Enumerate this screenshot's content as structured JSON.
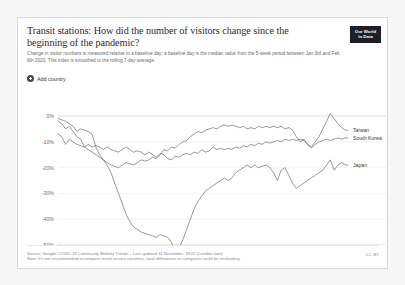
{
  "card": {
    "title": "Transit stations: How did the number of visitors change since the beginning of the pandemic?",
    "subtitle": "Change in visitor numbers is measured relative to a baseline day; a baseline day is the median value from the 5-week period between Jan 3rd and Feb 6th 2020. This index is smoothed to the rolling 7-day average.",
    "logo_line1": "Our World",
    "logo_line2": "in Data"
  },
  "controls": {
    "add_country_label": "Add country",
    "add_country_icon": "plus-circle-icon"
  },
  "footer": {
    "source_line": "Source: Google COVID-19 Community Mobility Trends  –  Last updated 11 November, 18:02 (London time)",
    "note_line": "Note: It's not recommended to compare levels across countries; local differences in categories could be misleading.",
    "license": "CC BY"
  },
  "chart_data": {
    "type": "line",
    "title": "Transit stations: How did the number of visitors change since the beginning of the pandemic?",
    "xlabel": "",
    "ylabel": "",
    "ylim": [
      -55,
      3
    ],
    "xlim": [
      0,
      230
    ],
    "grid": true,
    "legend_position": "right-inline",
    "ytick_labels": [
      "0%",
      "-10%",
      "-20%",
      "-30%",
      "-40%",
      "-50%"
    ],
    "ytick_values": [
      0,
      -10,
      -20,
      -30,
      -40,
      -50
    ],
    "xtick_labels": [
      "Feb 17, 2020",
      "Apr 30",
      "Jun 19",
      "Aug 8",
      "Oct 4, 2020"
    ],
    "xtick_values": [
      0,
      73,
      123,
      173,
      230
    ],
    "series": [
      {
        "name": "Taiwan",
        "label_y": -5.5,
        "values": [
          [
            0,
            -1
          ],
          [
            3,
            -1.5
          ],
          [
            6,
            -2
          ],
          [
            9,
            -3
          ],
          [
            12,
            -4
          ],
          [
            15,
            -6
          ],
          [
            18,
            -5
          ],
          [
            21,
            -5.5
          ],
          [
            24,
            -6
          ],
          [
            27,
            -7
          ],
          [
            30,
            -12
          ],
          [
            33,
            -15
          ],
          [
            36,
            -17
          ],
          [
            39,
            -18
          ],
          [
            42,
            -19
          ],
          [
            45,
            -19.5
          ],
          [
            48,
            -20
          ],
          [
            51,
            -19
          ],
          [
            54,
            -18
          ],
          [
            57,
            -18.5
          ],
          [
            60,
            -19
          ],
          [
            63,
            -18
          ],
          [
            66,
            -17
          ],
          [
            69,
            -17.5
          ],
          [
            72,
            -17
          ],
          [
            75,
            -16
          ],
          [
            78,
            -16.5
          ],
          [
            81,
            -15
          ],
          [
            84,
            -13
          ],
          [
            87,
            -13.5
          ],
          [
            90,
            -12
          ],
          [
            93,
            -12.5
          ],
          [
            96,
            -11
          ],
          [
            99,
            -10
          ],
          [
            102,
            -9.5
          ],
          [
            105,
            -8
          ],
          [
            108,
            -7
          ],
          [
            111,
            -6
          ],
          [
            114,
            -6.5
          ],
          [
            117,
            -5.5
          ],
          [
            120,
            -5
          ],
          [
            123,
            -4.5
          ],
          [
            126,
            -5
          ],
          [
            129,
            -4
          ],
          [
            132,
            -3.5
          ],
          [
            135,
            -4
          ],
          [
            138,
            -3.5
          ],
          [
            141,
            -4
          ],
          [
            144,
            -4.5
          ],
          [
            147,
            -4
          ],
          [
            150,
            -5
          ],
          [
            153,
            -4.5
          ],
          [
            156,
            -5
          ],
          [
            159,
            -4
          ],
          [
            162,
            -4.5
          ],
          [
            165,
            -4
          ],
          [
            168,
            -4.5
          ],
          [
            171,
            -4
          ],
          [
            174,
            -4.5
          ],
          [
            177,
            -4
          ],
          [
            180,
            -5
          ],
          [
            183,
            -4.5
          ],
          [
            186,
            -5.5
          ],
          [
            189,
            -8
          ],
          [
            192,
            -10
          ],
          [
            195,
            -9
          ],
          [
            198,
            -11
          ],
          [
            201,
            -12
          ],
          [
            204,
            -10
          ],
          [
            207,
            -8
          ],
          [
            210,
            -5
          ],
          [
            213,
            -2
          ],
          [
            216,
            1
          ],
          [
            219,
            -1
          ],
          [
            222,
            -3
          ],
          [
            225,
            -4.5
          ],
          [
            228,
            -5.5
          ],
          [
            230,
            -5.5
          ]
        ]
      },
      {
        "name": "South Korea",
        "label_y": -8.5,
        "values": [
          [
            0,
            -7
          ],
          [
            3,
            -8
          ],
          [
            6,
            -11
          ],
          [
            9,
            -9
          ],
          [
            12,
            -10
          ],
          [
            15,
            -11
          ],
          [
            18,
            -11.5
          ],
          [
            21,
            -12
          ],
          [
            24,
            -11
          ],
          [
            27,
            -12
          ],
          [
            30,
            -11.5
          ],
          [
            33,
            -12
          ],
          [
            36,
            -13
          ],
          [
            39,
            -12
          ],
          [
            42,
            -13
          ],
          [
            45,
            -13.5
          ],
          [
            48,
            -14
          ],
          [
            51,
            -13
          ],
          [
            54,
            -12
          ],
          [
            57,
            -13
          ],
          [
            60,
            -14
          ],
          [
            63,
            -13.5
          ],
          [
            66,
            -14
          ],
          [
            69,
            -15
          ],
          [
            72,
            -14
          ],
          [
            75,
            -15
          ],
          [
            78,
            -16
          ],
          [
            81,
            -14.5
          ],
          [
            84,
            -15
          ],
          [
            87,
            -16.5
          ],
          [
            90,
            -17
          ],
          [
            93,
            -15.5
          ],
          [
            96,
            -16
          ],
          [
            99,
            -15
          ],
          [
            102,
            -14.5
          ],
          [
            105,
            -15
          ],
          [
            108,
            -14
          ],
          [
            111,
            -14.5
          ],
          [
            114,
            -13
          ],
          [
            117,
            -14
          ],
          [
            120,
            -13.5
          ],
          [
            123,
            -12
          ],
          [
            126,
            -13
          ],
          [
            129,
            -12.5
          ],
          [
            132,
            -13
          ],
          [
            135,
            -12.5
          ],
          [
            138,
            -13
          ],
          [
            141,
            -12
          ],
          [
            144,
            -12.5
          ],
          [
            147,
            -11.5
          ],
          [
            150,
            -12
          ],
          [
            153,
            -11
          ],
          [
            156,
            -11.5
          ],
          [
            159,
            -10.5
          ],
          [
            162,
            -11
          ],
          [
            165,
            -10
          ],
          [
            168,
            -10.5
          ],
          [
            171,
            -10
          ],
          [
            174,
            -9.5
          ],
          [
            177,
            -10
          ],
          [
            180,
            -9
          ],
          [
            183,
            -9.5
          ],
          [
            186,
            -9
          ],
          [
            189,
            -9.5
          ],
          [
            192,
            -9
          ],
          [
            195,
            -9.5
          ],
          [
            198,
            -11
          ],
          [
            201,
            -12.5
          ],
          [
            204,
            -11
          ],
          [
            207,
            -10
          ],
          [
            210,
            -9.5
          ],
          [
            213,
            -9
          ],
          [
            216,
            -9.5
          ],
          [
            219,
            -9
          ],
          [
            222,
            -8.5
          ],
          [
            225,
            -9
          ],
          [
            228,
            -8.5
          ],
          [
            230,
            -8.5
          ]
        ]
      },
      {
        "name": "Japan",
        "label_y": -19,
        "values": [
          [
            0,
            -2
          ],
          [
            3,
            -3
          ],
          [
            6,
            -5
          ],
          [
            9,
            -4
          ],
          [
            12,
            -6
          ],
          [
            15,
            -8
          ],
          [
            18,
            -9
          ],
          [
            21,
            -12
          ],
          [
            24,
            -13
          ],
          [
            27,
            -14
          ],
          [
            30,
            -15
          ],
          [
            33,
            -16
          ],
          [
            36,
            -17
          ],
          [
            39,
            -19
          ],
          [
            42,
            -22
          ],
          [
            45,
            -26
          ],
          [
            48,
            -30
          ],
          [
            51,
            -34
          ],
          [
            54,
            -38
          ],
          [
            57,
            -41
          ],
          [
            60,
            -43
          ],
          [
            63,
            -44
          ],
          [
            66,
            -45
          ],
          [
            69,
            -45.5
          ],
          [
            72,
            -46
          ],
          [
            75,
            -46.5
          ],
          [
            78,
            -47
          ],
          [
            81,
            -46
          ],
          [
            84,
            -46.5
          ],
          [
            87,
            -47
          ],
          [
            90,
            -49
          ],
          [
            93,
            -52
          ],
          [
            96,
            -51
          ],
          [
            99,
            -48
          ],
          [
            102,
            -44
          ],
          [
            105,
            -40
          ],
          [
            108,
            -36
          ],
          [
            111,
            -33
          ],
          [
            114,
            -31
          ],
          [
            117,
            -29
          ],
          [
            120,
            -28
          ],
          [
            123,
            -27
          ],
          [
            126,
            -26
          ],
          [
            129,
            -25
          ],
          [
            132,
            -24
          ],
          [
            135,
            -25
          ],
          [
            138,
            -24
          ],
          [
            141,
            -22
          ],
          [
            144,
            -21
          ],
          [
            147,
            -20
          ],
          [
            150,
            -19
          ],
          [
            153,
            -20
          ],
          [
            156,
            -19
          ],
          [
            159,
            -20
          ],
          [
            162,
            -19.5
          ],
          [
            165,
            -19
          ],
          [
            168,
            -20
          ],
          [
            171,
            -22
          ],
          [
            174,
            -25
          ],
          [
            177,
            -21
          ],
          [
            180,
            -20
          ],
          [
            183,
            -23
          ],
          [
            186,
            -26
          ],
          [
            189,
            -28
          ],
          [
            192,
            -27
          ],
          [
            195,
            -26
          ],
          [
            198,
            -25
          ],
          [
            201,
            -24
          ],
          [
            204,
            -23
          ],
          [
            207,
            -22
          ],
          [
            210,
            -21
          ],
          [
            213,
            -19
          ],
          [
            216,
            -17
          ],
          [
            219,
            -21
          ],
          [
            222,
            -19
          ],
          [
            225,
            -18
          ],
          [
            228,
            -19
          ],
          [
            230,
            -19
          ]
        ]
      }
    ]
  }
}
